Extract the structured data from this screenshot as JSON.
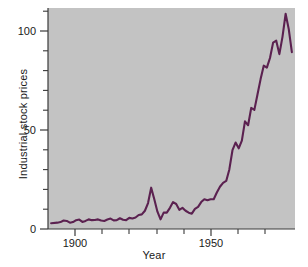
{
  "chart_data": {
    "type": "line",
    "title": "",
    "xlabel": "Year",
    "ylabel": "Industrial stock prices",
    "xlim": [
      1896,
      1975
    ],
    "ylim": [
      0,
      115
    ],
    "grid": false,
    "legend": "none",
    "line_color": "#5b2150",
    "plot_background": "#c3c3c3",
    "figure_background": "#ffffff",
    "x_major_ticks": [
      1900,
      1950
    ],
    "x_major_tick_labels": [
      "1900",
      "1950"
    ],
    "x_minor_ticks": [
      1910,
      1920,
      1930,
      1940,
      1960,
      1970
    ],
    "y_major_ticks": [
      0,
      50,
      100
    ],
    "y_major_tick_labels": [
      "0",
      "50",
      "100"
    ],
    "y_minor_ticks": [
      10,
      20,
      30,
      40,
      60,
      70,
      80,
      90,
      110
    ],
    "x": [
      1897,
      1899,
      1900,
      1901,
      1902,
      1903,
      1904,
      1905,
      1906,
      1907,
      1908,
      1909,
      1910,
      1911,
      1912,
      1913,
      1914,
      1915,
      1916,
      1917,
      1918,
      1919,
      1920,
      1921,
      1922,
      1923,
      1924,
      1925,
      1926,
      1927,
      1928,
      1929,
      1930,
      1931,
      1932,
      1933,
      1934,
      1935,
      1936,
      1937,
      1938,
      1939,
      1940,
      1941,
      1942,
      1943,
      1944,
      1945,
      1946,
      1947,
      1948,
      1949,
      1950,
      1951,
      1952,
      1953,
      1954,
      1955,
      1956,
      1957,
      1958,
      1959,
      1960,
      1961,
      1962,
      1963,
      1964,
      1965,
      1966,
      1967,
      1968,
      1969,
      1970,
      1971,
      1972,
      1973,
      1974
    ],
    "y": [
      3.0,
      3.3,
      3.6,
      4.4,
      4.2,
      3.3,
      3.6,
      4.6,
      4.9,
      3.7,
      4.2,
      5.0,
      4.6,
      4.7,
      5.0,
      4.4,
      4.2,
      4.9,
      5.4,
      4.5,
      4.6,
      5.6,
      4.8,
      4.6,
      5.8,
      5.5,
      6.0,
      7.3,
      7.6,
      9.5,
      13.5,
      21.5,
      15.5,
      9.0,
      5.0,
      8.5,
      8.5,
      11.0,
      14.0,
      13.0,
      10.0,
      11.0,
      9.5,
      8.5,
      8.0,
      10.5,
      11.5,
      14.0,
      15.5,
      15.0,
      15.5,
      15.5,
      19.0,
      22.0,
      24.0,
      25.0,
      31.0,
      41.0,
      45.0,
      42.0,
      46.0,
      56.0,
      54.0,
      63.0,
      62.0,
      70.0,
      78.0,
      85.0,
      84.0,
      89.0,
      97.0,
      98.0,
      91.0,
      100.0,
      112.0,
      104.0,
      92.0
    ]
  },
  "labels": {
    "ylabel": "Industrial stock prices",
    "xlabel": "Year",
    "y_tick_0": "0",
    "y_tick_50": "50",
    "y_tick_100": "100",
    "x_tick_1900": "1900",
    "x_tick_1950": "1950"
  }
}
